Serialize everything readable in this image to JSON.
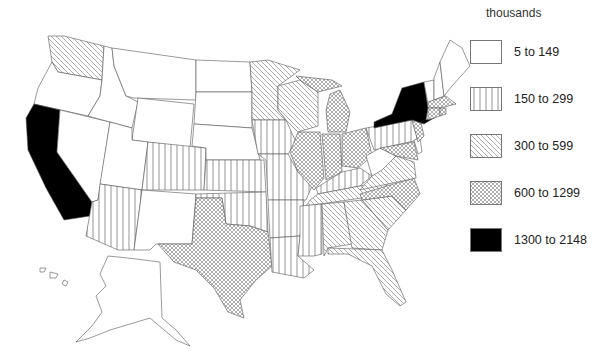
{
  "title": "",
  "legend": {
    "title": "thousands",
    "items": [
      {
        "label": "5 to 149",
        "pattern": "none"
      },
      {
        "label": "150 to 299",
        "pattern": "vertical"
      },
      {
        "label": "300 to 599",
        "pattern": "diagonal"
      },
      {
        "label": "600 to 1299",
        "pattern": "crosshatch"
      },
      {
        "label": "1300 to 2148",
        "pattern": "solid"
      }
    ]
  },
  "map": {
    "region": "United States",
    "classes": {
      "5 to 149": [
        "OR",
        "NV",
        "ID",
        "MT",
        "WY",
        "UT",
        "NM",
        "ND",
        "SD",
        "NE",
        "ME",
        "VT",
        "NH",
        "WV",
        "DE",
        "AK",
        "HI"
      ],
      "150 to 299": [
        "AZ",
        "CO",
        "KS",
        "IA",
        "MO",
        "OK",
        "AR",
        "LA",
        "MS",
        "KY",
        "PA"
      ],
      "300 to 599": [
        "WA",
        "MN",
        "WI",
        "TN",
        "VA",
        "AL",
        "GA",
        "SC",
        "FL"
      ],
      "600 to 1299": [
        "TX",
        "IL",
        "IN",
        "OH",
        "MI",
        "NC",
        "NJ",
        "MD",
        "MA",
        "CT",
        "RI"
      ],
      "1300 to 2148": [
        "CA",
        "NY"
      ]
    }
  },
  "colors": {
    "fill_solid": "#000000",
    "stroke": "#555555",
    "background": "#ffffff"
  }
}
